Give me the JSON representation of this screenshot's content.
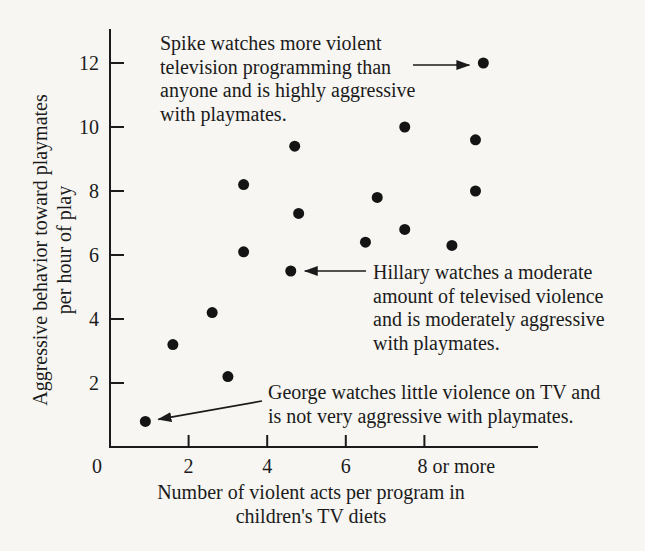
{
  "figure": {
    "background": "#f7f6f2",
    "ink": "#1b1b1b"
  },
  "chart_data": {
    "type": "scatter",
    "xlabel_line1": "Number of violent acts per program in",
    "xlabel_line2": "children's TV diets",
    "ylabel_line1": "Aggressive behavior toward playmates",
    "ylabel_line2": "per hour of play",
    "xlim": [
      0,
      10.9
    ],
    "ylim": [
      0,
      12.9
    ],
    "grid": false,
    "x_ticks": [
      {
        "value": 0,
        "label": "0"
      },
      {
        "value": 2,
        "label": "2"
      },
      {
        "value": 4,
        "label": "4"
      },
      {
        "value": 6,
        "label": "6"
      },
      {
        "value": 8,
        "label": "8 or more"
      }
    ],
    "y_ticks": [
      2,
      4,
      6,
      8,
      10,
      12
    ],
    "points": [
      {
        "x": 0.9,
        "y": 0.8,
        "label": "George"
      },
      {
        "x": 1.6,
        "y": 3.2
      },
      {
        "x": 2.6,
        "y": 4.2
      },
      {
        "x": 3.0,
        "y": 2.2
      },
      {
        "x": 3.4,
        "y": 6.1
      },
      {
        "x": 3.4,
        "y": 8.2
      },
      {
        "x": 4.6,
        "y": 5.5,
        "label": "Hillary"
      },
      {
        "x": 4.7,
        "y": 9.4
      },
      {
        "x": 4.8,
        "y": 7.3
      },
      {
        "x": 6.5,
        "y": 6.4
      },
      {
        "x": 6.8,
        "y": 7.8
      },
      {
        "x": 7.5,
        "y": 6.8
      },
      {
        "x": 7.5,
        "y": 10.0
      },
      {
        "x": 8.7,
        "y": 6.3
      },
      {
        "x": 9.3,
        "y": 8.0
      },
      {
        "x": 9.3,
        "y": 9.6
      },
      {
        "x": 9.5,
        "y": 12.0,
        "label": "Spike"
      }
    ]
  },
  "annotations": [
    {
      "id": "spike",
      "lines": [
        "Spike watches more violent",
        "television programming than",
        "anyone and is highly aggressive",
        "with playmates."
      ]
    },
    {
      "id": "hillary",
      "lines": [
        "Hillary watches a moderate",
        "amount of televised violence",
        "and is moderately aggressive",
        "with playmates."
      ]
    },
    {
      "id": "george",
      "lines": [
        "George watches little violence on TV and",
        "is not very aggressive with playmates."
      ]
    }
  ]
}
